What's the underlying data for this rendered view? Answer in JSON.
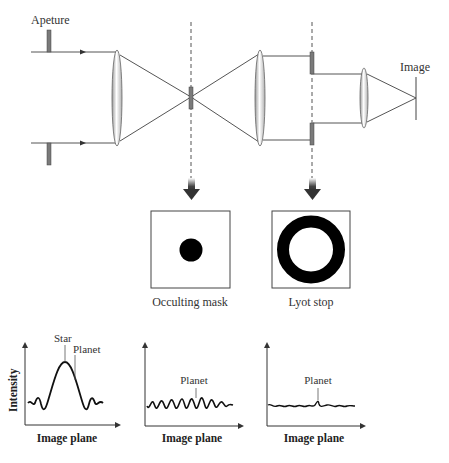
{
  "diagram": {
    "labels": {
      "aperture": "Apeture",
      "image": "Image",
      "occulting_mask": "Occulting mask",
      "lyot_stop": "Lyot stop"
    },
    "colors": {
      "line": "#555555",
      "plate": "#7a7a7a",
      "mask": "#000000",
      "arrow": "#444444",
      "text": "#333333"
    }
  },
  "plots": [
    {
      "ylabel": "Intensity",
      "xlabel": "Image plane",
      "annotations": [
        "Star",
        "Planet"
      ],
      "description": "Strong central star peak with side lobes; planet hidden on flank"
    },
    {
      "ylabel": "",
      "xlabel": "Image plane",
      "annotations": [
        "Planet"
      ],
      "description": "Star suppressed by occulting mask; ringing residuals comparable to planet"
    },
    {
      "ylabel": "",
      "xlabel": "Image plane",
      "annotations": [
        "Planet"
      ],
      "description": "After Lyot stop, low residual ripple; planet visible as small bump"
    }
  ]
}
